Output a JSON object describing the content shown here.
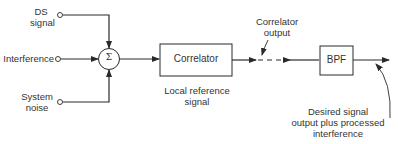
{
  "diagram": {
    "inputs": [
      {
        "id": "ds",
        "label_line1": "DS",
        "label_line2": "signal"
      },
      {
        "id": "interference",
        "label_line1": "Interference"
      },
      {
        "id": "noise",
        "label_line1": "System",
        "label_line2": "noise"
      }
    ],
    "summer": {
      "symbol": "Σ"
    },
    "correlator": {
      "label": "Correlator",
      "caption_line1": "Local reference",
      "caption_line2": "signal"
    },
    "correlator_output": {
      "line1": "Correlator",
      "line2": "output"
    },
    "bpf": {
      "label": "BPF"
    },
    "output_note": {
      "line1": "Desired signal",
      "line2": "output plus processed",
      "line3": "interference"
    },
    "colors": {
      "stroke": "#2a2a2a",
      "background": "#ffffff"
    }
  }
}
